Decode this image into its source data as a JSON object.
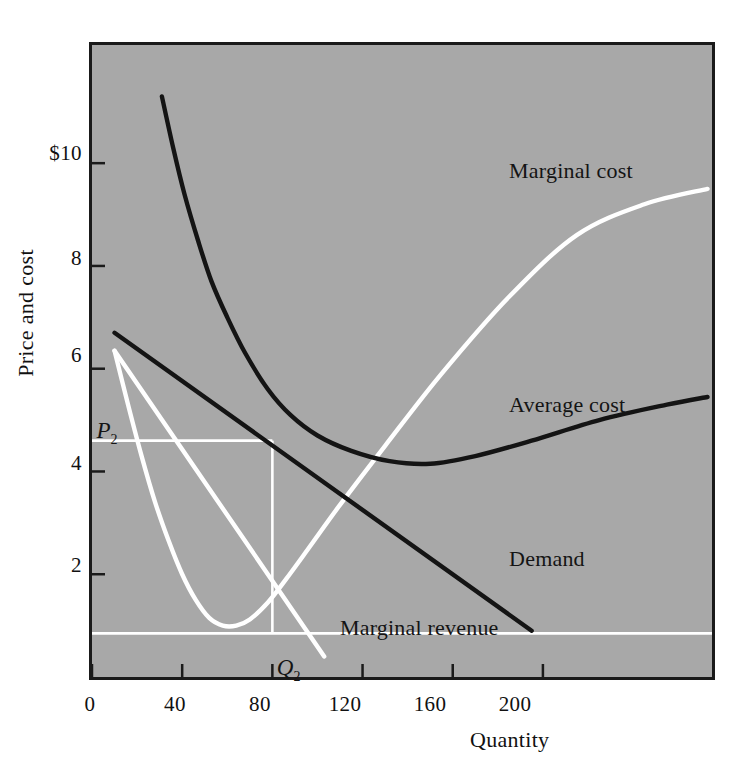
{
  "chart_data": {
    "type": "line",
    "title": "",
    "xlabel": "Quantity",
    "ylabel": "Price and cost",
    "xlim": [
      0,
      275
    ],
    "ylim": [
      0,
      12.3
    ],
    "grid": false,
    "legend_position": "inline-annotations",
    "xticks": [
      {
        "label": "0",
        "value": 0
      },
      {
        "label": "40",
        "value": 40
      },
      {
        "label": "80",
        "value": 80
      },
      {
        "label": "120",
        "value": 120
      },
      {
        "label": "160",
        "value": 160
      },
      {
        "label": "200",
        "value": 200
      }
    ],
    "yticks": [
      {
        "label": "$10",
        "value": 10
      },
      {
        "label": "8",
        "value": 8
      },
      {
        "label": "6",
        "value": 6
      },
      {
        "label": "4",
        "value": 4
      },
      {
        "label": "2",
        "value": 2
      }
    ],
    "series": [
      {
        "name": "Marginal cost",
        "color": "#ffffff",
        "style": "solid",
        "points": [
          [
            10,
            6.35
          ],
          [
            16,
            5.3
          ],
          [
            22,
            4.3
          ],
          [
            28,
            3.4
          ],
          [
            34,
            2.65
          ],
          [
            40,
            2.0
          ],
          [
            46,
            1.5
          ],
          [
            52,
            1.15
          ],
          [
            58,
            1.0
          ],
          [
            64,
            1.0
          ],
          [
            70,
            1.12
          ],
          [
            78,
            1.45
          ],
          [
            86,
            1.9
          ],
          [
            96,
            2.5
          ],
          [
            110,
            3.35
          ],
          [
            130,
            4.5
          ],
          [
            155,
            5.9
          ],
          [
            185,
            7.4
          ],
          [
            215,
            8.6
          ],
          [
            245,
            9.2
          ],
          [
            273,
            9.5
          ]
        ]
      },
      {
        "name": "Average cost",
        "color": "#141414",
        "style": "solid",
        "points": [
          [
            31,
            11.3
          ],
          [
            36,
            10.3
          ],
          [
            41,
            9.4
          ],
          [
            47,
            8.5
          ],
          [
            53,
            7.7
          ],
          [
            60,
            7.0
          ],
          [
            68,
            6.3
          ],
          [
            78,
            5.6
          ],
          [
            88,
            5.1
          ],
          [
            100,
            4.7
          ],
          [
            115,
            4.4
          ],
          [
            132,
            4.2
          ],
          [
            150,
            4.15
          ],
          [
            170,
            4.3
          ],
          [
            195,
            4.6
          ],
          [
            225,
            5.0
          ],
          [
            255,
            5.3
          ],
          [
            273,
            5.45
          ]
        ]
      },
      {
        "name": "Demand",
        "color": "#141414",
        "style": "solid",
        "points": [
          [
            10,
            6.7
          ],
          [
            195,
            0.9
          ]
        ]
      },
      {
        "name": "Marginal revenue",
        "color": "#ffffff",
        "style": "solid",
        "points": [
          [
            10,
            6.35
          ],
          [
            103,
            0.4
          ]
        ]
      }
    ],
    "annotations": [
      {
        "name": "Marginal cost",
        "text": "Marginal cost",
        "x": 185,
        "y": 10.1,
        "color": "#141414"
      },
      {
        "name": "Average cost",
        "text": "Average cost",
        "x": 185,
        "y": 5.55,
        "color": "#141414"
      },
      {
        "name": "Demand",
        "text": "Demand",
        "x": 185,
        "y": 2.55,
        "color": "#141414"
      },
      {
        "name": "Marginal revenue",
        "text": "Marginal revenue",
        "x": 110,
        "y": 1.2,
        "color": "#141414"
      },
      {
        "name": "P2",
        "text": "P",
        "sub": "2",
        "x": 2,
        "y": 5.05,
        "color": "#141414"
      },
      {
        "name": "Q2",
        "text": "Q",
        "sub": "2",
        "x": 82,
        "y": 0.42,
        "color": "#141414"
      }
    ],
    "guides": [
      {
        "name": "price-guide",
        "orientation": "horizontal",
        "value": 4.6,
        "from": 0,
        "to": 80,
        "color": "#ffffff"
      },
      {
        "name": "quantity-guide",
        "orientation": "vertical",
        "value": 80,
        "from": 0.85,
        "to": 4.6,
        "color": "#ffffff"
      },
      {
        "name": "mr-baseline-guide",
        "orientation": "horizontal",
        "value": 0.85,
        "from": 0,
        "to": 275,
        "color": "#ffffff"
      }
    ],
    "colors": {
      "plot_background": "#a8a8a8",
      "page_background": "#ffffff",
      "frame": "#1a1a1a",
      "dark_series": "#141414",
      "light_series": "#ffffff"
    }
  }
}
